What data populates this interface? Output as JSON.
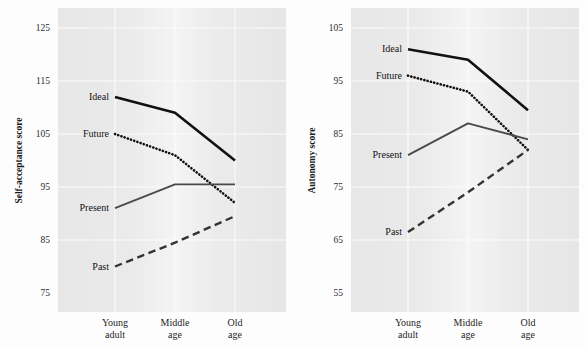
{
  "figure": {
    "background_color": "#fdfdfd",
    "plot_background_color": "#e9e9e9",
    "gridline_color": "#fbfbfb"
  },
  "chart_data": [
    {
      "type": "line",
      "panel": "left",
      "title": "",
      "xlabel": "",
      "ylabel": "Self-acceptance score",
      "categories": [
        "Young\nadult",
        "Middle\nage",
        "Old\nage"
      ],
      "category_lines": [
        [
          "Young",
          "adult"
        ],
        [
          "Middle",
          "age"
        ],
        [
          "Old",
          "age"
        ]
      ],
      "ylim": [
        75,
        125
      ],
      "yticks": [
        75,
        85,
        95,
        105,
        115,
        125
      ],
      "ytick_labels": [
        "75",
        "85",
        "95",
        "105",
        "115",
        "125"
      ],
      "grid": true,
      "legend": "inline-labels",
      "series": [
        {
          "name": "Ideal",
          "values": [
            112.0,
            109.0,
            100.0
          ],
          "style": "solid",
          "color": "#111111",
          "width": 2.6,
          "label_anchor": "left"
        },
        {
          "name": "Future",
          "values": [
            105.0,
            101.0,
            92.0
          ],
          "style": "dotted",
          "color": "#111111",
          "width": 2.6,
          "label_anchor": "left"
        },
        {
          "name": "Present",
          "values": [
            91.0,
            95.5,
            95.5
          ],
          "style": "solid",
          "color": "#4a4a4a",
          "width": 1.9,
          "label_anchor": "left"
        },
        {
          "name": "Past",
          "values": [
            80.0,
            84.5,
            89.5
          ],
          "style": "dashed",
          "color": "#333333",
          "width": 2.4,
          "label_anchor": "left"
        }
      ]
    },
    {
      "type": "line",
      "panel": "right",
      "title": "",
      "xlabel": "",
      "ylabel": "Autonomy score",
      "categories": [
        "Young\nadult",
        "Middle\nage",
        "Old\nage"
      ],
      "category_lines": [
        [
          "Young",
          "adult"
        ],
        [
          "Middle",
          "age"
        ],
        [
          "Old",
          "age"
        ]
      ],
      "ylim": [
        55,
        105
      ],
      "yticks": [
        55,
        65,
        75,
        85,
        95,
        105
      ],
      "ytick_labels": [
        "55",
        "65",
        "75",
        "85",
        "95",
        "105"
      ],
      "grid": true,
      "legend": "inline-labels",
      "series": [
        {
          "name": "Ideal",
          "values": [
            101.0,
            99.0,
            89.5
          ],
          "style": "solid",
          "color": "#111111",
          "width": 2.6,
          "label_anchor": "left"
        },
        {
          "name": "Future",
          "values": [
            96.0,
            93.0,
            82.0
          ],
          "style": "dotted",
          "color": "#111111",
          "width": 2.6,
          "label_anchor": "left"
        },
        {
          "name": "Present",
          "values": [
            81.0,
            87.0,
            84.0
          ],
          "style": "solid",
          "color": "#4a4a4a",
          "width": 1.9,
          "label_anchor": "left"
        },
        {
          "name": "Past",
          "values": [
            66.5,
            74.0,
            82.0
          ],
          "style": "dashed",
          "color": "#333333",
          "width": 2.4,
          "label_anchor": "left"
        }
      ]
    }
  ]
}
